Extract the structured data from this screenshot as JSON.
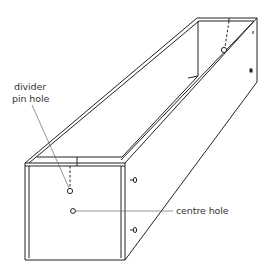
{
  "diagram": {
    "colors": {
      "line": "#222222",
      "leader": "#666666",
      "background": "#ffffff"
    },
    "labels": [
      {
        "id": "divider-pin-hole",
        "lines": [
          "divider",
          "pin hole"
        ]
      },
      {
        "id": "centre-hole",
        "lines": [
          "centre hole"
        ]
      }
    ]
  }
}
